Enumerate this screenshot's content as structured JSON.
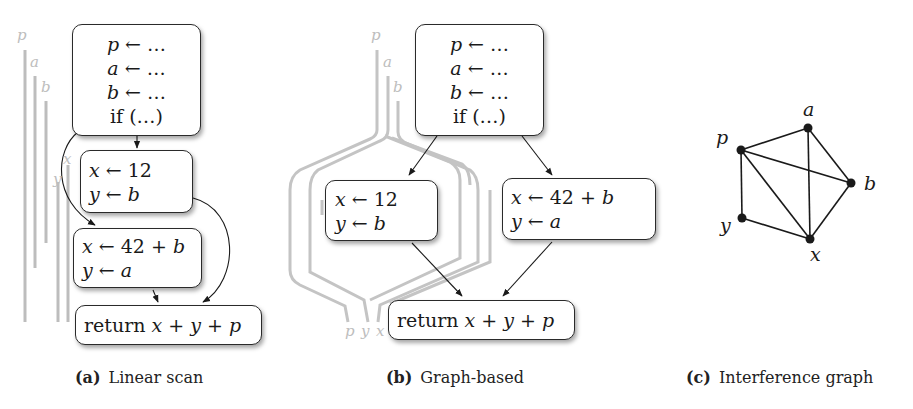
{
  "panels": {
    "a": {
      "caption_tag": "(a)",
      "caption_text": "Linear scan",
      "entry_block": [
        "p ← …",
        "a ← …",
        "b ← …",
        "if (…)"
      ],
      "then_block": [
        "x ← 12",
        "y ← b"
      ],
      "else_block": [
        "x ← 42 + b",
        "y ← a"
      ],
      "exit_block": [
        "return  x + y + p"
      ],
      "lifetime_labels": [
        "p",
        "a",
        "b",
        "x",
        "y"
      ]
    },
    "b": {
      "caption_tag": "(b)",
      "caption_text": "Graph-based",
      "entry_block": [
        "p ← …",
        "a ← …",
        "b ← …",
        "if (…)"
      ],
      "then_block": [
        "x ← 12",
        "y ← b"
      ],
      "else_block": [
        "x ← 42 + b",
        "y ← a"
      ],
      "exit_block": [
        "return  x + y + p"
      ],
      "top_labels": [
        "p",
        "a",
        "b"
      ],
      "bottom_labels": [
        "p",
        "y",
        "x"
      ]
    },
    "c": {
      "caption_tag": "(c)",
      "caption_text": "Interference graph",
      "nodes": [
        {
          "id": "a",
          "label": "a"
        },
        {
          "id": "p",
          "label": "p"
        },
        {
          "id": "b",
          "label": "b"
        },
        {
          "id": "y",
          "label": "y"
        },
        {
          "id": "x",
          "label": "x"
        }
      ],
      "edges": [
        [
          "p",
          "a"
        ],
        [
          "p",
          "b"
        ],
        [
          "p",
          "x"
        ],
        [
          "p",
          "y"
        ],
        [
          "a",
          "b"
        ],
        [
          "a",
          "x"
        ],
        [
          "b",
          "x"
        ],
        [
          "y",
          "x"
        ]
      ]
    }
  },
  "colors": {
    "box_border": "#2a2a2a",
    "lifetime": "#bdbdbd",
    "edge": "#1a1a1a"
  }
}
